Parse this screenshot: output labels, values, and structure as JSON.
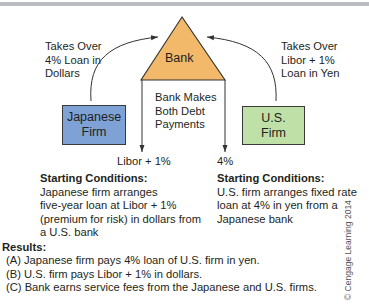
{
  "colors": {
    "bank_fill": "#f3b96a",
    "japanese_firm_fill": "#7ea1d6",
    "us_firm_fill": "#bfe0a6",
    "line": "#333333",
    "top_rule": "#b9bdc0"
  },
  "diagram": {
    "bank": {
      "label": "Bank"
    },
    "japanese_firm": {
      "label_line1": "Japanese",
      "label_line2": "Firm"
    },
    "us_firm": {
      "label_line1": "U.S.",
      "label_line2": "Firm"
    },
    "left_arrow_label": [
      "Takes Over",
      "4% Loan in",
      "Dollars"
    ],
    "right_arrow_label": [
      "Takes Over",
      "Libor + 1%",
      "Loan in Yen"
    ],
    "center_label": [
      "Bank Makes",
      "Both Debt",
      "Payments"
    ],
    "left_payment": "Libor + 1%",
    "right_payment": "4%"
  },
  "starting_conditions": {
    "left": {
      "heading": "Starting Conditions:",
      "lines": [
        "Japanese firm arranges",
        "five-year loan at Libor + 1%",
        "(premium for risk) in dollars from",
        "a U.S. bank"
      ]
    },
    "right": {
      "heading": "Starting Conditions:",
      "lines": [
        "U.S. firm arranges fixed rate",
        "loan at 4% in yen from a",
        "Japanese bank"
      ]
    }
  },
  "results": {
    "heading": "Results:",
    "items": [
      "(A) Japanese firm pays 4% loan of U.S. firm in yen.",
      "(B) U.S. firm pays Libor + 1% in dollars.",
      "(C) Bank earns service fees from the Japanese and U.S. firms."
    ]
  },
  "copyright": "© Cengage Learning 2014"
}
